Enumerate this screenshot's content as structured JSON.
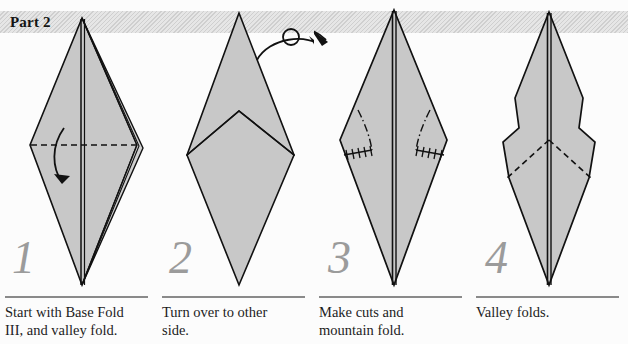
{
  "document": {
    "title": "Part 2",
    "type": "origami-instruction-diagram",
    "background_color": "#fcfcfc",
    "paper_fill_color": "#c8c8c8",
    "paper_fill_color_light": "#d2d2d2",
    "line_color": "#111111",
    "step_number_color": "#9b9b9b",
    "banner_color": "#d2d2d2"
  },
  "banner": {
    "label": "Part 2"
  },
  "steps": [
    {
      "number": "1",
      "caption": "Start with Base Fold III, and valley fold.",
      "caption_lines": [
        "Start with Base Fold",
        "III, and valley fold."
      ],
      "annotations": [
        "horizontal-valley-fold-dashed",
        "curved-fold-arrow-down"
      ]
    },
    {
      "number": "2",
      "caption": "Turn over to other side.",
      "caption_lines": [
        "Turn over to other",
        "side."
      ],
      "annotations": [
        "turn-over-loop-arrow"
      ]
    },
    {
      "number": "3",
      "caption": "Make cuts and mountain fold.",
      "caption_lines": [
        "Make cuts and",
        "mountain fold."
      ],
      "annotations": [
        "mountain-fold-dash-dot-left",
        "mountain-fold-dash-dot-right",
        "cut-line-zigzag-left",
        "cut-line-zigzag-right",
        "turn-over-arrow-tail"
      ]
    },
    {
      "number": "4",
      "caption": "Valley folds.",
      "caption_lines": [
        "Valley folds."
      ],
      "annotations": [
        "valley-fold-dashed-left",
        "valley-fold-dashed-right"
      ]
    }
  ]
}
